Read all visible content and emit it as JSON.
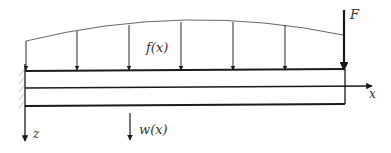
{
  "diagram": {
    "type": "cantilever-beam-loading",
    "labels": {
      "distributed_load": "f(x)",
      "point_load": "F",
      "x_axis": "x",
      "z_axis": "z",
      "deflection": "w(x)"
    },
    "colors": {
      "beam": "#1a1a1a",
      "load_arrows": "#2a2a2a",
      "load_curve": "#555555",
      "hatch": "#bbbbbb"
    }
  }
}
